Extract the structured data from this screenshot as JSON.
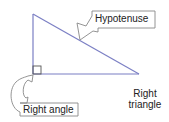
{
  "diagram": {
    "title": "Right triangle",
    "labels": {
      "hypotenuse": "Hypotenuse",
      "right_angle": "Right angle",
      "right_triangle": "Right triangle"
    },
    "colors": {
      "triangle_stroke": "#7b7fc4",
      "callout_stroke": "#888888",
      "text": "#222222"
    },
    "vertices": {
      "top": [
        33,
        14
      ],
      "right_angle": [
        33,
        74
      ],
      "right": [
        139,
        74
      ]
    }
  }
}
